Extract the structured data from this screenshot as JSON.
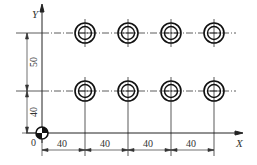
{
  "diagram": {
    "axes": {
      "x_label": "X",
      "y_label": "Y",
      "origin_label": "0"
    },
    "dimensions": {
      "horizontal": [
        "40",
        "40",
        "40",
        "40"
      ],
      "vertical": [
        "40",
        "50"
      ]
    },
    "holes": {
      "rows": 2,
      "columns": 4,
      "x_spacing": 40,
      "y_spacing": 50,
      "first_x": 40,
      "first_y": 40
    },
    "colors": {
      "line": "#222222",
      "background": "#ffffff"
    }
  }
}
